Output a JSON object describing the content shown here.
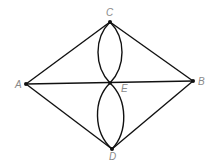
{
  "diagram": {
    "type": "graph",
    "nodes": [
      {
        "id": "A",
        "label": "A",
        "x": 26,
        "y": 84,
        "lx": 16,
        "ly": 88
      },
      {
        "id": "B",
        "label": "B",
        "x": 193,
        "y": 81,
        "lx": 198,
        "ly": 85
      },
      {
        "id": "C",
        "label": "C",
        "x": 110,
        "y": 22,
        "lx": 106,
        "ly": 16
      },
      {
        "id": "D",
        "label": "D",
        "x": 112,
        "y": 149,
        "lx": 109,
        "ly": 160
      },
      {
        "id": "E",
        "label": "E",
        "x": 110,
        "y": 83,
        "lx": 121,
        "ly": 92
      }
    ],
    "edges": [
      {
        "from": "A",
        "to": "C",
        "shape": "line"
      },
      {
        "from": "C",
        "to": "B",
        "shape": "line"
      },
      {
        "from": "A",
        "to": "D",
        "shape": "line"
      },
      {
        "from": "D",
        "to": "B",
        "shape": "line"
      },
      {
        "from": "A",
        "to": "B",
        "shape": "line",
        "via": "E"
      },
      {
        "from": "C",
        "to": "E",
        "shape": "arc-left"
      },
      {
        "from": "C",
        "to": "E",
        "shape": "arc-right"
      },
      {
        "from": "E",
        "to": "D",
        "shape": "arc-left"
      },
      {
        "from": "E",
        "to": "D",
        "shape": "arc-right"
      }
    ]
  },
  "labels": {
    "A": "A",
    "B": "B",
    "C": "C",
    "D": "D",
    "E": "E"
  }
}
